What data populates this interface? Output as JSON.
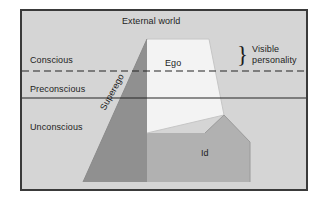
{
  "figure": {
    "frame": {
      "border_color": "#3a3a3a",
      "background_color": "#d5d5d5"
    }
  },
  "labels": {
    "external_world": "External world",
    "conscious": "Conscious",
    "preconscious": "Preconscious",
    "unconscious": "Unconscious",
    "ego": "Ego",
    "id": "Id",
    "superego": "Superego",
    "visible_personality": "Visible personality",
    "brace_glyph": "}"
  },
  "regions": [
    {
      "name": "ego",
      "label": "Ego",
      "color": "#f3f3f3"
    },
    {
      "name": "superego",
      "label": "Superego",
      "color": "#909090"
    },
    {
      "name": "id",
      "label": "Id",
      "color": "#b1b1b1"
    }
  ],
  "levels": [
    {
      "name": "conscious",
      "label": "Conscious",
      "divider": "dashed"
    },
    {
      "name": "preconscious",
      "label": "Preconscious",
      "divider": "solid"
    },
    {
      "name": "unconscious",
      "label": "Unconscious",
      "divider": "none"
    }
  ],
  "colors": {
    "background": "#d5d5d5",
    "frame_border": "#3a3a3a",
    "ego_fill": "#f3f3f3",
    "superego_fill": "#909090",
    "id_fill": "#b1b1b1",
    "line": "#242424",
    "text": "#1d1d1d"
  }
}
